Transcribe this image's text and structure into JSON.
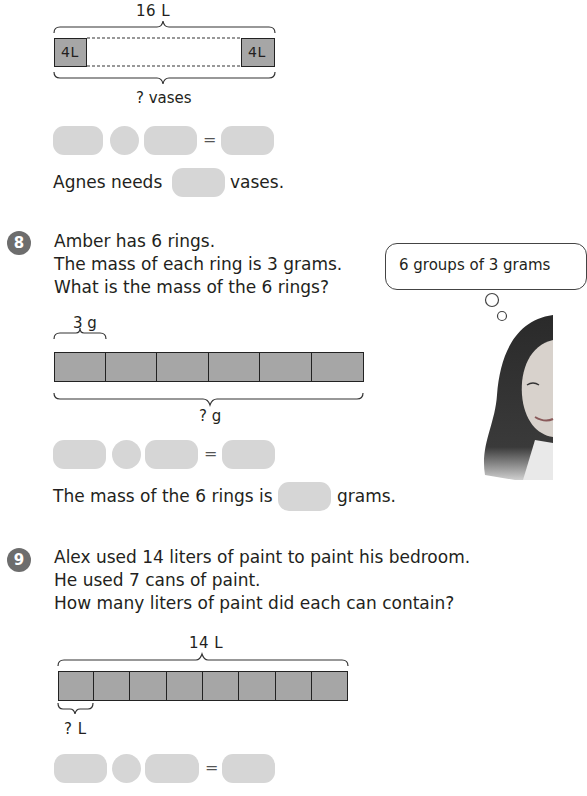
{
  "problem7": {
    "bar_total_label": "16 L",
    "left_cell_label": "4L",
    "right_cell_label": "4L",
    "bar_bottom_label": "? vases",
    "answer_sentence_before": "Agnes needs",
    "answer_sentence_after": "vases.",
    "equals": "="
  },
  "problem8": {
    "number": "8",
    "lines": [
      "Amber has 6 rings.",
      "The mass of each ring is 3 grams.",
      "What is the mass of the 6 rings?"
    ],
    "unit_label": "3 g",
    "bar_cells": 6,
    "bar_bottom_label": "? g",
    "thought_bubble": "6 groups of 3 grams",
    "answer_sentence_before": "The mass of the 6 rings is",
    "answer_sentence_after": "grams.",
    "equals": "="
  },
  "problem9": {
    "number": "9",
    "lines": [
      "Alex used 14 liters of paint to paint his bedroom.",
      "He used 7 cans of paint.",
      "How many liters of paint did each can contain?"
    ],
    "bar_total_label": "14 L",
    "bar_cells": 8,
    "unit_label": "? L",
    "equals": "="
  },
  "colors": {
    "bar_fill": "#a6a6a6",
    "answer_box": "#d6d6d6",
    "number_badge": "#6d6d6d"
  }
}
